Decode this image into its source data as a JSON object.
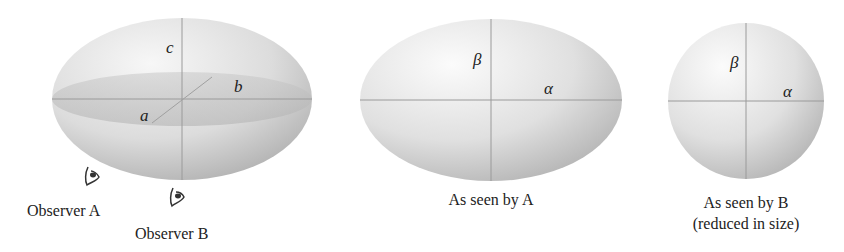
{
  "figure": {
    "ellipsoid": {
      "labels": {
        "a": "a",
        "b": "b",
        "c": "c"
      }
    },
    "observers": [
      {
        "label": "Observer A",
        "icon": "eye-icon"
      },
      {
        "label": "Observer B",
        "icon": "eye-icon"
      }
    ],
    "view_a": {
      "labels": {
        "alpha": "α",
        "beta": "β"
      },
      "caption": "As seen by A"
    },
    "view_b": {
      "labels": {
        "alpha": "α",
        "beta": "β"
      },
      "caption_line1": "As seen by B",
      "caption_line2": "(reduced in size)"
    },
    "colors": {
      "surface_light": "#f4f4f4",
      "surface_dark": "#a9a9a9",
      "axis_line": "#9a9a9a",
      "text": "#222222"
    }
  }
}
